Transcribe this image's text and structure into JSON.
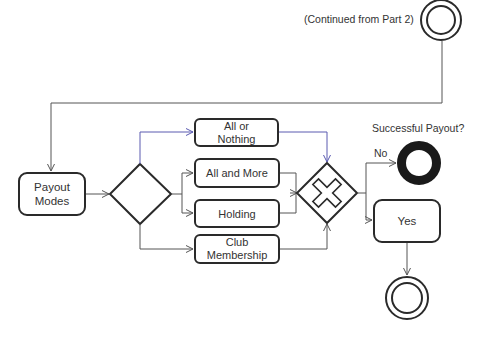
{
  "diagram": {
    "type": "bpmn-flow",
    "continued_label": "(Continued from Part 2)",
    "nodes": {
      "payout_modes": "Payout\nModes",
      "all_or_nothing": "All or\nNothing",
      "all_and_more": "All and More",
      "holding": "Holding",
      "club_membership": "Club\nMembership",
      "yes": "Yes"
    },
    "question_label": "Successful Payout?",
    "no_label": "No",
    "colors": {
      "stroke": "#2a2a2a",
      "connector": "#555555",
      "highlight_connector": "#5a5ab0",
      "background": "#ffffff"
    },
    "gateways": [
      {
        "id": "split-gateway",
        "kind": "inclusive/plain diamond"
      },
      {
        "id": "merge-gateway",
        "kind": "parallel/exclusive cross"
      }
    ],
    "events": [
      {
        "id": "intermediate-start",
        "kind": "double-circle",
        "position": "top-right"
      },
      {
        "id": "end-fail",
        "kind": "thick-ring",
        "label": "No"
      },
      {
        "id": "end-success",
        "kind": "double-circle",
        "position": "bottom-right"
      }
    ]
  }
}
